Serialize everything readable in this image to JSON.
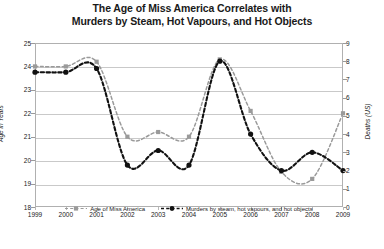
{
  "chart_data": {
    "type": "line",
    "title": "The Age of Miss America Correlates with Murders by Steam, Hot Vapours, and Hot Objects",
    "title_line1": "The Age of Miss America Correlates with",
    "title_line2": "Murders by Steam, Hot Vapours, and Hot Objects",
    "xlabel": "",
    "categories": [
      "1999",
      "2000",
      "2001",
      "2002",
      "2003",
      "2004",
      "2005",
      "2006",
      "2007",
      "2008",
      "2009"
    ],
    "grid": true,
    "legend_position": "bottom-inside",
    "axes": {
      "left": {
        "label": "Age in Years",
        "ticks": [
          "25",
          "24",
          "23",
          "22",
          "21",
          "20",
          "19",
          "18"
        ],
        "min": 18,
        "max": 25
      },
      "right": {
        "label": "Deaths (US)",
        "ticks": [
          "9",
          "8",
          "7",
          "6",
          "5",
          "4",
          "3",
          "2",
          "1",
          "0"
        ],
        "min": 0,
        "max": 9
      }
    },
    "series": [
      {
        "name": "Age of Miss America",
        "axis": "left",
        "color": "#9a9a9a",
        "style": "dashed",
        "marker": "square",
        "values": [
          24.0,
          24.0,
          24.2,
          21.0,
          21.2,
          21.0,
          24.3,
          22.1,
          19.5,
          19.2,
          22.0
        ]
      },
      {
        "name": "Murders by steam, hot vapours, and hot objects",
        "axis": "right",
        "color": "#111111",
        "style": "dashed",
        "marker": "circle",
        "values": [
          7.4,
          7.4,
          7.6,
          2.3,
          3.1,
          2.3,
          8.0,
          4.0,
          2.0,
          3.0,
          2.0
        ]
      }
    ]
  }
}
